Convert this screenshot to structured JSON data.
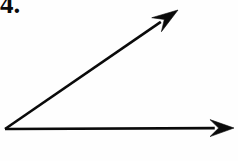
{
  "figure": {
    "kind": "geometry-angle-diagram",
    "problem_number": "4.",
    "background_color": "#fefefe",
    "stroke_color": "#0a0a0a",
    "canvas": {
      "width": 238,
      "height": 161
    },
    "vertex": {
      "x": 5,
      "y": 129,
      "label": ""
    },
    "rays": [
      {
        "name": "horizontal-ray",
        "from": {
          "x": 5,
          "y": 129
        },
        "to": {
          "x": 234,
          "y": 128
        },
        "direction_degrees": 0,
        "stroke_width": 2.6,
        "arrowhead": {
          "style": "solid-barbed",
          "length": 24,
          "half_width": 8.5
        }
      },
      {
        "name": "diagonal-ray",
        "from": {
          "x": 5,
          "y": 129
        },
        "to": {
          "x": 178,
          "y": 10
        },
        "direction_degrees": 34.5,
        "stroke_width": 2.6,
        "arrowhead": {
          "style": "solid-barbed",
          "length": 26,
          "half_width": 8.5
        }
      }
    ],
    "angle_measure_label": "",
    "tick_marks": 0
  }
}
